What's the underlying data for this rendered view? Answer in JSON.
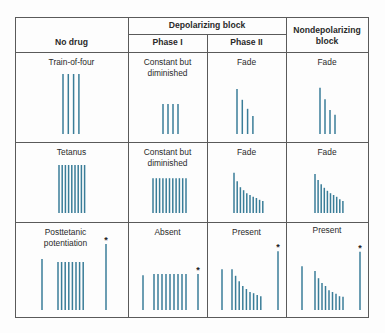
{
  "figure": {
    "bar_color": "#3a7d98",
    "line_color": "#5a5a5a",
    "star_marker": "*"
  },
  "header": {
    "col_no_drug": "No drug",
    "depolarizing_group": "Depolarizing block",
    "phase_1": "Phase I",
    "phase_2": "Phase II",
    "nondepolarizing": "Nondepolarizing\nblock"
  },
  "rows": [
    {
      "id": "train-of-four",
      "cells": [
        {
          "label": "Train-of-four",
          "groups": [
            [
              1,
              1,
              1,
              1
            ]
          ],
          "star_group": null
        },
        {
          "label": "Constant but\ndiminished",
          "groups": [
            [
              0.5,
              0.5,
              0.5,
              0.5
            ]
          ],
          "star_group": null
        },
        {
          "label": "Fade",
          "groups": [
            [
              0.75,
              0.57,
              0.42,
              0.3
            ]
          ],
          "star_group": null
        },
        {
          "label": "Fade",
          "groups": [
            [
              0.77,
              0.58,
              0.4,
              0.32
            ]
          ],
          "star_group": null
        }
      ]
    },
    {
      "id": "tetanus",
      "cells": [
        {
          "label": "Tetanus",
          "groups": [
            [
              0.8,
              0.8,
              0.8,
              0.8,
              0.8,
              0.8,
              0.8,
              0.8,
              0.8
            ]
          ],
          "star_group": null
        },
        {
          "label": "Constant but\ndiminished",
          "groups": [
            [
              0.58,
              0.58,
              0.58,
              0.58,
              0.58,
              0.58,
              0.58,
              0.58,
              0.58,
              0.58,
              0.58
            ]
          ],
          "star_group": null
        },
        {
          "label": "Fade",
          "groups": [
            [
              0.67,
              0.53,
              0.43,
              0.38,
              0.33,
              0.3,
              0.27,
              0.25,
              0.22,
              0.2
            ]
          ],
          "star_group": null
        },
        {
          "label": "Fade",
          "groups": [
            [
              0.65,
              0.55,
              0.48,
              0.42,
              0.37,
              0.33,
              0.3,
              0.27,
              0.23,
              0.2
            ]
          ],
          "star_group": null
        }
      ]
    },
    {
      "id": "posttetanic-potentiation",
      "cells": [
        {
          "label": "Posttetanic\npotentiation",
          "groups": [
            [
              0.85
            ],
            [
              0.8,
              0.8,
              0.8,
              0.8,
              0.8,
              0.8,
              0.8,
              0.8
            ],
            [
              1.1
            ]
          ],
          "star_group": 2
        },
        {
          "label": "Absent",
          "groups": [
            [
              0.58
            ],
            [
              0.6,
              0.6,
              0.6,
              0.6,
              0.6,
              0.6,
              0.6,
              0.6,
              0.6
            ],
            [
              0.6
            ]
          ],
          "star_group": 2
        },
        {
          "label": "Present",
          "groups": [
            [
              0.68
            ],
            [
              0.68,
              0.57,
              0.48,
              0.4,
              0.35,
              0.3,
              0.28,
              0.25,
              0.23
            ],
            [
              0.98
            ]
          ],
          "star_group": 2
        },
        {
          "label": "Present",
          "groups": [
            [
              0.73
            ],
            [
              0.65,
              0.53,
              0.45,
              0.4,
              0.33,
              0.3,
              0.27,
              0.23,
              0.22
            ],
            [
              0.97
            ]
          ],
          "star_group": 2
        }
      ]
    }
  ]
}
